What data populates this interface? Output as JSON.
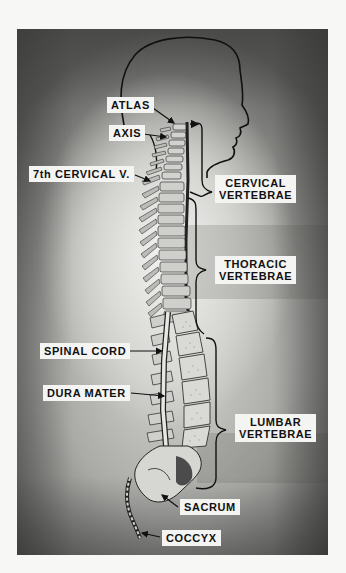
{
  "figure": {
    "colors": {
      "page_background": "#f7f7f5",
      "plate_light": "#e6e6e3",
      "plate_dark": "#5c5c5a",
      "label_background": "#f4f4f2",
      "ink": "#111111",
      "bone": "#cfcfcc"
    }
  },
  "labels": {
    "atlas": "ATLAS",
    "axis": "AXIS",
    "seventh_cervical": "7th CERVICAL V.",
    "cervical": {
      "line1": "CERVICAL",
      "line2": "VERTEBRAE"
    },
    "thoracic": {
      "line1": "THORACIC",
      "line2": "VERTEBRAE"
    },
    "spinal_cord": "SPINAL CORD",
    "dura_mater": "DURA MATER",
    "lumbar": {
      "line1": "LUMBAR",
      "line2": "VERTEBRAE"
    },
    "sacrum": "SACRUM",
    "coccyx": "COCCYX"
  }
}
